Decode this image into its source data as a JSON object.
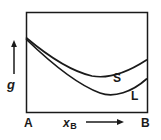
{
  "figure": {
    "background_color": "#ffffff",
    "line_color": "#1a1a1a",
    "frame": {
      "left": 26,
      "top": 12,
      "right": 147,
      "bottom": 112,
      "border_width": 1.5
    }
  },
  "axes": {
    "y_axis": {
      "label": "g",
      "arrow_direction": "up",
      "arrow_x": 14,
      "arrow_top": 42,
      "arrow_bottom": 74
    },
    "x_axis": {
      "label": "x",
      "label_subscript": "B",
      "arrow_direction": "right",
      "arrow_y": 122,
      "arrow_left": 86,
      "arrow_right": 124,
      "start_tick_label": "A",
      "end_tick_label": "B"
    }
  },
  "curve_labels": [
    {
      "text": "S",
      "meaning": "solid-phase-curve"
    },
    {
      "text": "L",
      "meaning": "liquid-phase-curve"
    }
  ],
  "chart_data": {
    "type": "line",
    "xlabel": "x_B",
    "ylabel": "g",
    "xlim": [
      0,
      1
    ],
    "ylim": [
      0,
      1
    ],
    "grid": false,
    "legend_position": "inline-curve-labels",
    "x_tick_labels": [
      "A",
      "B"
    ],
    "y_tick_labels": [],
    "annotations": [
      "S",
      "L"
    ],
    "series": [
      {
        "name": "S",
        "label": "S",
        "description": "solid phase free energy curve, shallow minimum near x=0.68",
        "x": [
          0.0,
          0.08,
          0.17,
          0.25,
          0.33,
          0.42,
          0.5,
          0.58,
          0.66,
          0.74,
          0.83,
          0.91,
          1.0
        ],
        "y": [
          0.74,
          0.672,
          0.61,
          0.556,
          0.51,
          0.472,
          0.444,
          0.426,
          0.42,
          0.428,
          0.456,
          0.506,
          0.58
        ]
      },
      {
        "name": "L",
        "label": "L",
        "description": "liquid phase free energy curve, deeper minimum near x=0.70",
        "x": [
          0.0,
          0.08,
          0.17,
          0.25,
          0.33,
          0.42,
          0.5,
          0.58,
          0.66,
          0.74,
          0.83,
          0.91,
          1.0
        ],
        "y": [
          0.73,
          0.628,
          0.534,
          0.45,
          0.376,
          0.314,
          0.266,
          0.234,
          0.22,
          0.228,
          0.262,
          0.33,
          0.43
        ]
      }
    ],
    "pixel_paths": {
      "S": "M 26.5,38 C 48,56 70,71 92,76 C 108,79 128,72 146.5,60",
      "L": "M 26.5,39.5 C 52,64 78,85 100,93 C 114,98 132,92 146.5,79"
    }
  }
}
